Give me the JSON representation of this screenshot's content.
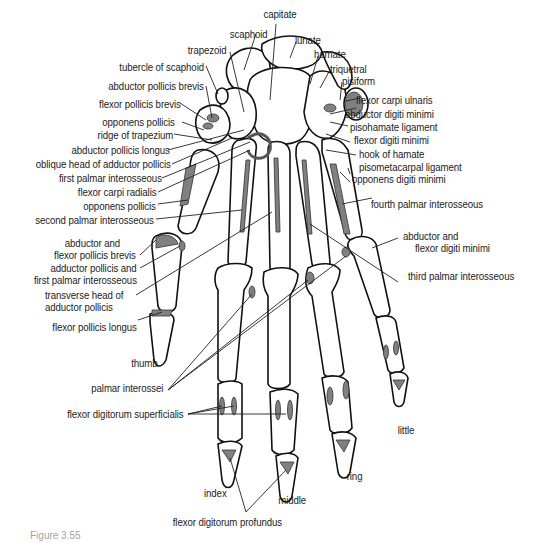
{
  "figure": {
    "caption_partial": "Figure 3.55",
    "colors": {
      "bone_outline": "#111111",
      "muscle_attachment": "#808080",
      "background": "#ffffff",
      "label_text": "#222222"
    }
  },
  "labels_top": {
    "capitate": "capitate",
    "scaphoid": "scaphoid",
    "lunate": "lunate",
    "trapezoid": "trapezoid",
    "hamate": "hamate",
    "triquetral": "triquetral",
    "pisiform": "pisiform"
  },
  "labels_left": [
    "tubercle of scaphoid",
    "abductor pollicis brevis",
    "flexor pollicis brevis",
    "opponens pollicis",
    "ridge of trapezium",
    "abductor pollicis longus",
    "oblique head of adductor pollicis",
    "first palmar interosseous",
    "flexor carpi radialis",
    "opponens pollicis",
    "second palmar interosseous",
    "abductor and",
    "flexor pollicis brevis",
    "adductor pollicis and",
    "first palmar interosseous",
    "transverse head of",
    "adductor pollicis",
    "flexor pollicis longus"
  ],
  "labels_right": [
    "flexor carpi ulnaris",
    "abductor digiti minimi",
    "pisohamate ligament",
    "flexor digiti minimi",
    "hook of hamate",
    "pisometacarpal ligament",
    "opponens digiti minimi",
    "fourth palmar interosseous",
    "abductor and",
    "flexor digiti minimi",
    "third palmar interosseous"
  ],
  "labels_bottom": {
    "thumb": "thumb",
    "palmar_interossei": "palmar interossei",
    "fds": "flexor digitorum superficialis",
    "little": "little",
    "ring": "ring",
    "index": "index",
    "middle": "middle",
    "fdp": "flexor digitorum profundus"
  }
}
